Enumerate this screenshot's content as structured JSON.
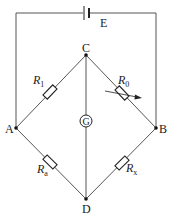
{
  "diagram": {
    "type": "Wheatstone bridge circuit",
    "battery": {
      "label": "E"
    },
    "nodes": {
      "top": "C",
      "left": "A",
      "right": "B",
      "bottom": "D"
    },
    "galvanometer": {
      "label": "G"
    },
    "resistors": {
      "upper_left": {
        "symbol": "R",
        "subscript": "1",
        "between": "A-C"
      },
      "upper_right": {
        "symbol": "R",
        "subscript": "0",
        "between": "C-B",
        "variable": true
      },
      "lower_left": {
        "symbol": "R",
        "subscript": "a",
        "between": "A-D"
      },
      "lower_right": {
        "symbol": "R",
        "subscript": "x",
        "between": "D-B"
      }
    }
  }
}
